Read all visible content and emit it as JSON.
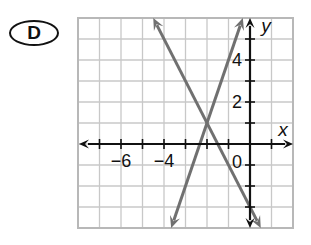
{
  "choice_label": "D",
  "colors": {
    "grid": "#c8c8c8",
    "border": "#b8b8b8",
    "axis": "#111111",
    "line": "#707070"
  },
  "chart_data": {
    "type": "line",
    "title": "",
    "xlabel": "x",
    "ylabel": "y",
    "xlim": [
      -8,
      2
    ],
    "ylim": [
      -4,
      6
    ],
    "grid": true,
    "grid_step": 1,
    "x_tick_labels": [
      {
        "value": -6,
        "label": "−6"
      },
      {
        "value": -4,
        "label": "−4"
      }
    ],
    "y_tick_labels": [
      {
        "value": 2,
        "label": "2"
      },
      {
        "value": 4,
        "label": "4"
      }
    ],
    "origin_label": "0",
    "series": [
      {
        "name": "line-decreasing",
        "equation": "y = -2x - 3",
        "points": [
          [
            -4.5,
            6
          ],
          [
            0.5,
            -4
          ]
        ],
        "arrows": "both"
      },
      {
        "name": "line-increasing",
        "equation": "y = 3x + 7",
        "points": [
          [
            -3.6667,
            -4
          ],
          [
            -0.3333,
            6
          ]
        ],
        "arrows": "both"
      }
    ],
    "intersection": [
      -2,
      1
    ],
    "legend": "none"
  }
}
